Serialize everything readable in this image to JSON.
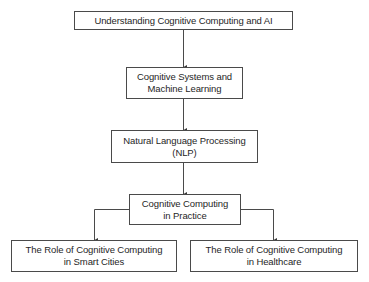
{
  "diagram": {
    "type": "flowchart",
    "nodes": [
      {
        "id": "n1",
        "label": "Understanding Cognitive Computing and AI"
      },
      {
        "id": "n2",
        "label": "Cognitive Systems and\nMachine Learning",
        "line1": "Cognitive Systems and",
        "line2": "Machine Learning"
      },
      {
        "id": "n3",
        "label": "Natural Language Processing\n(NLP)",
        "line1": "Natural Language Processing",
        "line2": "(NLP)"
      },
      {
        "id": "n4",
        "label": "Cognitive Computing\nin Practice",
        "line1": "Cognitive Computing",
        "line2": "in Practice"
      },
      {
        "id": "n5",
        "label": "The Role of Cognitive Computing\nin Smart Cities",
        "line1": "The Role of Cognitive Computing",
        "line2": "in Smart Cities"
      },
      {
        "id": "n6",
        "label": "The Role of Cognitive Computing\nin Healthcare",
        "line1": "The Role of Cognitive Computing",
        "line2": "in Healthcare"
      }
    ],
    "edges": [
      {
        "from": "n1",
        "to": "n2"
      },
      {
        "from": "n2",
        "to": "n3"
      },
      {
        "from": "n3",
        "to": "n4"
      },
      {
        "from": "n4",
        "to": "n5"
      },
      {
        "from": "n4",
        "to": "n6"
      }
    ],
    "colors": {
      "border": "#4a4a4a",
      "line": "#4a4a4a",
      "text": "#262626",
      "background": "#ffffff"
    }
  }
}
